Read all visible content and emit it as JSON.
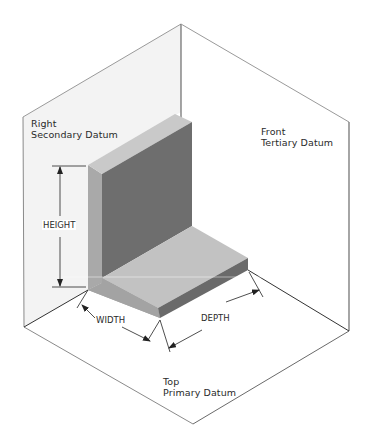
{
  "diagram": {
    "type": "isometric datum reference frame",
    "planes": [
      {
        "id": "right",
        "line1": "Right",
        "line2": "Secondary Datum"
      },
      {
        "id": "front",
        "line1": "Front",
        "line2": "Tertiary Datum"
      },
      {
        "id": "top",
        "line1": "Top",
        "line2": "Primary Datum"
      }
    ],
    "dimensions": {
      "height": "HEIGHT",
      "width": "WIDTH",
      "depth": "DEPTH"
    },
    "colors": {
      "plane_left_fill": "#f3f3f3",
      "plane_line": "#8c8c8c",
      "block_top_light": "#c4c4c4",
      "block_front_dark": "#6e6e6e",
      "block_side_mid": "#a6a6a6",
      "dim_line": "#222222"
    }
  }
}
